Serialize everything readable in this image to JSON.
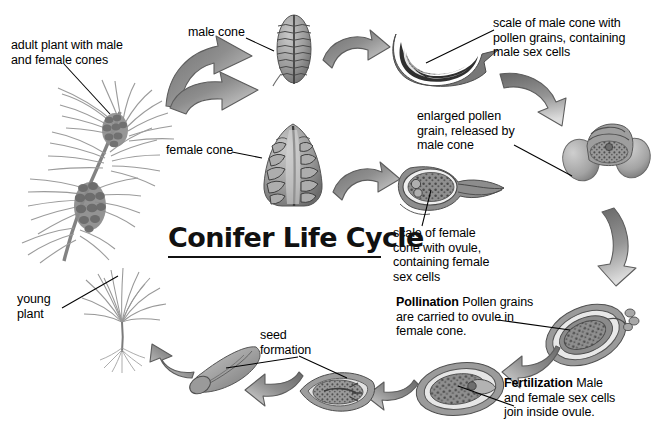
{
  "diagram": {
    "title": "Conifer Life Cycle",
    "background_color": "#ffffff",
    "text_color": "#000000",
    "arrow_dark": "#6f6f6f",
    "arrow_light": "#d6d6d6"
  },
  "labels": {
    "adult_plant": "adult plant with male\nand female cones",
    "male_cone": "male cone",
    "female_cone": "female cone",
    "scale_male": "scale of male cone with\npollen grains, containing\nmale sex cells",
    "pollen_grain": "enlarged pollen\ngrain, released by\nmale cone",
    "scale_female": "scale of female\ncone with ovule,\ncontaining female\nsex cells",
    "pollination_term": "Pollination",
    "pollination_text": "Pollen grains\nare carried to ovule in\nfemale cone.",
    "fertilization_term": "Fertilization",
    "fertilization_text": "Male\nand female sex cells\njoin inside ovule.",
    "seed_formation": "seed\nformation",
    "young_plant": "young\nplant"
  },
  "illustrations": {
    "adult_plant": "pine-branch-with-cones",
    "male_cone": "male-cone",
    "female_cone": "female-cone",
    "male_scale": "male-cone-scale-cross-section",
    "pollen_grain": "pollen-grain-with-air-sacs",
    "female_scale": "female-cone-scale-with-ovule",
    "pollinated_ovule": "ovule-receiving-pollen",
    "fertilized_ovule": "fertilized-ovule",
    "developing_seed": "scale-with-developing-seed",
    "winged_seed": "winged-seed",
    "seedling": "young-pine-seedling"
  },
  "arrows": [
    {
      "name": "forked-arrow-to-cones",
      "direction": "right-split"
    },
    {
      "name": "arrow-male-cone-to-scale",
      "direction": "right"
    },
    {
      "name": "arrow-scale-to-pollen",
      "direction": "down-right"
    },
    {
      "name": "arrow-female-cone-to-scale",
      "direction": "right"
    },
    {
      "name": "arrow-pollen-to-pollination",
      "direction": "down"
    },
    {
      "name": "arrow-pollination-to-fertilization",
      "direction": "down-left"
    },
    {
      "name": "arrow-fertilization-to-seed",
      "direction": "left"
    },
    {
      "name": "arrow-seed-to-winged-seed",
      "direction": "left"
    },
    {
      "name": "arrow-seed-to-seedling",
      "direction": "up-left"
    }
  ]
}
